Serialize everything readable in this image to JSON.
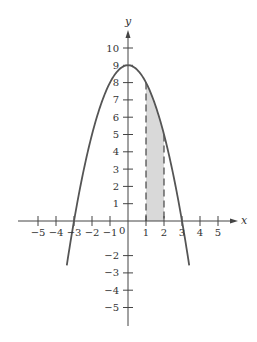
{
  "chart_data": {
    "type": "line",
    "title": "",
    "xlabel": "x",
    "ylabel": "y",
    "function": "y = 9 - x^2",
    "xlim": [
      -5,
      5
    ],
    "ylim": [
      -5,
      10
    ],
    "grid": false,
    "x_ticks": [
      -5,
      -4,
      -3,
      -2,
      -1,
      1,
      2,
      3,
      4,
      5
    ],
    "x_tick_labels": [
      "−5",
      "−4",
      "−3",
      "−2",
      "−1",
      "1",
      "2",
      "3",
      "4",
      "5"
    ],
    "y_ticks": [
      1,
      2,
      3,
      4,
      5,
      6,
      7,
      8,
      9,
      10,
      -2,
      -3,
      -4,
      -5
    ],
    "y_tick_labels": [
      "1",
      "2",
      "3",
      "4",
      "5",
      "6",
      "7",
      "8",
      "9",
      "10",
      "−2",
      "−3",
      "−4",
      "−5"
    ],
    "origin_label": "0",
    "curve_domain": [
      -3.4,
      3.4
    ],
    "shaded_region": {
      "x_from": 1,
      "x_to": 2,
      "under": "curve",
      "fill": "#d9d9d9"
    },
    "dashed_lines": [
      {
        "x": 1,
        "y_top": 8
      },
      {
        "x": 2,
        "y_top": 5
      }
    ],
    "series": [
      {
        "name": "9 - x^2",
        "x": [
          -3.4,
          -3,
          -2,
          -1,
          0,
          1,
          2,
          3,
          3.4
        ],
        "values": [
          -2.56,
          0,
          5,
          8,
          9,
          8,
          5,
          0,
          -2.56
        ],
        "color": "#555555"
      }
    ]
  }
}
